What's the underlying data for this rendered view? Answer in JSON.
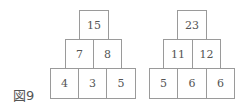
{
  "figure": {
    "label": "図9",
    "pyramids": [
      {
        "top": [
          "15"
        ],
        "middle": [
          "7",
          "8"
        ],
        "bottom": [
          "4",
          "3",
          "5"
        ]
      },
      {
        "top": [
          "23"
        ],
        "middle": [
          "11",
          "12"
        ],
        "bottom": [
          "5",
          "6",
          "6"
        ]
      }
    ]
  }
}
